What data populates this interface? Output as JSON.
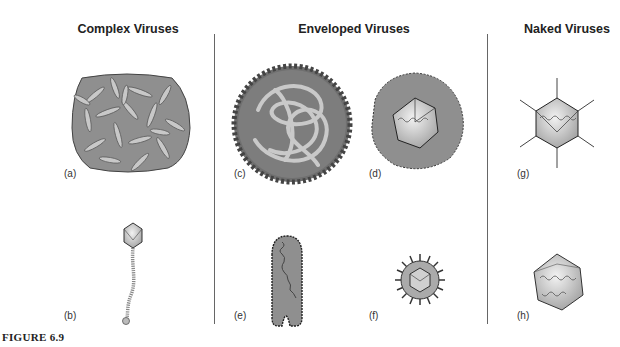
{
  "figure": {
    "caption": "FIGURE 6.9",
    "columns": [
      {
        "title": "Complex Viruses"
      },
      {
        "title": "Enveloped Viruses"
      },
      {
        "title": "Naked Viruses"
      }
    ],
    "panels": [
      {
        "label": "(a)",
        "description": "brick-shaped complex virus (poxvirus-like)"
      },
      {
        "label": "(b)",
        "description": "bacteriophage with icosahedral head and tail"
      },
      {
        "label": "(c)",
        "description": "spherical enveloped virus with coiled nucleocapsid"
      },
      {
        "label": "(d)",
        "description": "enveloped icosahedral virus"
      },
      {
        "label": "(e)",
        "description": "bullet-shaped enveloped virus with helical nucleocapsid"
      },
      {
        "label": "(f)",
        "description": "spiked spherical enveloped virus"
      },
      {
        "label": "(g)",
        "description": "naked icosahedral virus with fibers"
      },
      {
        "label": "(h)",
        "description": "naked icosahedral virus"
      }
    ]
  }
}
